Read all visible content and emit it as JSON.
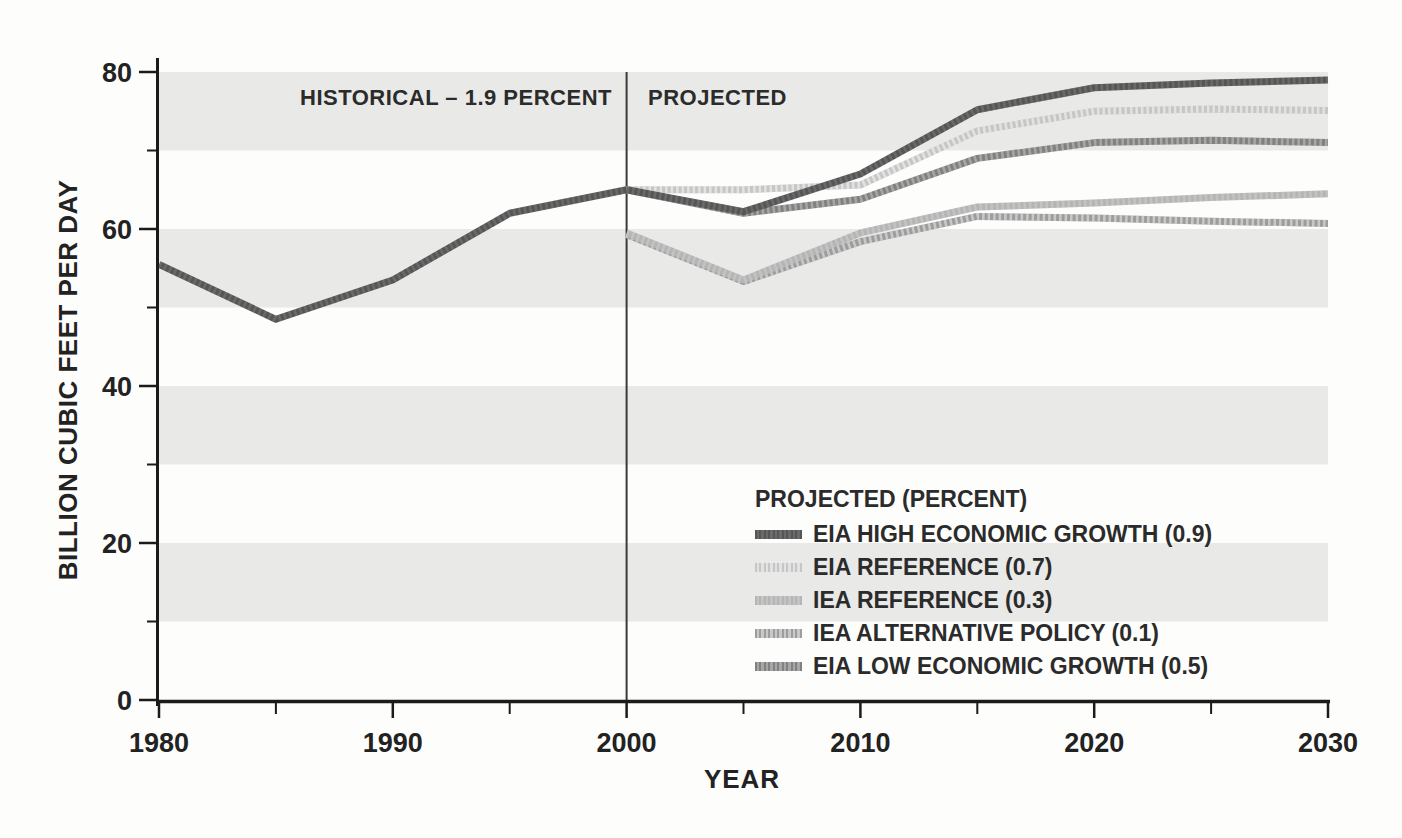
{
  "page": {
    "background_color": "#fdfdfc",
    "band_color": "#e9e9e8",
    "axis_color": "#1b1b1b",
    "divider_color": "#3a3a3a",
    "text_color": "#2b2b2b"
  },
  "chart_data": {
    "type": "line",
    "x_axis": {
      "label": "YEAR",
      "range": [
        1980,
        2030
      ],
      "ticks": [
        1980,
        1990,
        2000,
        2010,
        2020,
        2030
      ],
      "minor_ticks": [
        1985,
        1995,
        2005,
        2015,
        2025
      ]
    },
    "y_axis": {
      "label": "BILLION CUBIC FEET PER DAY",
      "range": [
        0,
        80
      ],
      "ticks": [
        0,
        20,
        40,
        60,
        80
      ],
      "minor_ticks": [
        10,
        30,
        50,
        70
      ]
    },
    "shaded_bands": [
      [
        10,
        20
      ],
      [
        30,
        40
      ],
      [
        50,
        60
      ],
      [
        70,
        80
      ]
    ],
    "divider_year": 2000,
    "annotations": {
      "historical": "HISTORICAL – 1.9 PERCENT",
      "projected": "PROJECTED"
    },
    "series": [
      {
        "id": "historical",
        "name": "HISTORICAL",
        "growth_percent": 1.9,
        "color": "#565656",
        "texture_opacity": 0.12,
        "points": [
          [
            1980,
            55.5
          ],
          [
            1985,
            48.5
          ],
          [
            1990,
            53.5
          ],
          [
            1995,
            62
          ],
          [
            2000,
            65
          ]
        ]
      },
      {
        "id": "eia_high",
        "name": "EIA HIGH ECONOMIC GROWTH",
        "growth_percent": 0.9,
        "color": "#565656",
        "texture_opacity": 0.12,
        "points": [
          [
            2000,
            65
          ],
          [
            2005,
            62.2
          ],
          [
            2010,
            67
          ],
          [
            2015,
            75.2
          ],
          [
            2020,
            78
          ],
          [
            2025,
            78.6
          ],
          [
            2030,
            79
          ]
        ]
      },
      {
        "id": "eia_reference",
        "name": "EIA REFERENCE",
        "growth_percent": 0.7,
        "color": "#c6c6c6",
        "texture_opacity": 0.5,
        "points": [
          [
            2000,
            65
          ],
          [
            2005,
            65
          ],
          [
            2010,
            65.6
          ],
          [
            2015,
            72.5
          ],
          [
            2020,
            75
          ],
          [
            2025,
            75.3
          ],
          [
            2030,
            75.1
          ]
        ]
      },
      {
        "id": "iea_reference",
        "name": "IEA REFERENCE",
        "growth_percent": 0.3,
        "color": "#b5b5b5",
        "texture_opacity": 0.2,
        "points": [
          [
            2000,
            59.5
          ],
          [
            2005,
            53.5
          ],
          [
            2010,
            59.5
          ],
          [
            2015,
            62.8
          ],
          [
            2020,
            63.3
          ],
          [
            2025,
            64
          ],
          [
            2030,
            64.5
          ]
        ]
      },
      {
        "id": "iea_alternative",
        "name": "IEA ALTERNATIVE POLICY",
        "growth_percent": 0.1,
        "color": "#9d9d9d",
        "texture_opacity": 0.45,
        "points": [
          [
            2000,
            59.3
          ],
          [
            2005,
            53.3
          ],
          [
            2010,
            58.4
          ],
          [
            2015,
            61.6
          ],
          [
            2020,
            61.4
          ],
          [
            2025,
            61
          ],
          [
            2030,
            60.7
          ]
        ]
      },
      {
        "id": "eia_low",
        "name": "EIA LOW ECONOMIC GROWTH",
        "growth_percent": 0.5,
        "color": "#818181",
        "texture_opacity": 0.3,
        "points": [
          [
            2000,
            65
          ],
          [
            2005,
            62
          ],
          [
            2010,
            63.8
          ],
          [
            2015,
            69
          ],
          [
            2020,
            71
          ],
          [
            2025,
            71.3
          ],
          [
            2030,
            71
          ]
        ]
      }
    ],
    "z_order": [
      "iea_alternative",
      "iea_reference",
      "eia_reference",
      "eia_low",
      "eia_high",
      "historical"
    ],
    "legend": {
      "title": "PROJECTED (PERCENT)",
      "items": [
        {
          "series": "eia_high",
          "label": "EIA HIGH ECONOMIC GROWTH (0.9)"
        },
        {
          "series": "eia_reference",
          "label": "EIA REFERENCE (0.7)"
        },
        {
          "series": "iea_reference",
          "label": "IEA REFERENCE (0.3)"
        },
        {
          "series": "iea_alternative",
          "label": "IEA ALTERNATIVE POLICY (0.1)"
        },
        {
          "series": "eia_low",
          "label": "EIA LOW ECONOMIC GROWTH (0.5)"
        }
      ]
    }
  }
}
